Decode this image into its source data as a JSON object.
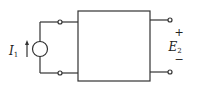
{
  "diagram": {
    "type": "two-port network",
    "source": {
      "kind": "current-source",
      "label": "I",
      "subscript": "1",
      "arrow_direction": "up"
    },
    "output": {
      "label": "E",
      "subscript": "2",
      "plus": "+",
      "minus": "−"
    }
  }
}
